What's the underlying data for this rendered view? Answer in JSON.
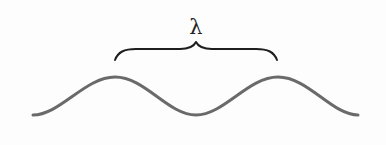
{
  "diagram": {
    "label": "λ",
    "label_meaning": "wavelength",
    "colors": {
      "background": "#fdfdfd",
      "wave": "#6a6a6a",
      "brace": "#1e1e1e",
      "label": "#222222"
    },
    "wave": {
      "start": [
        33,
        115
      ],
      "end": [
        358,
        115
      ],
      "peaks": [
        [
          115,
          77
        ],
        [
          278,
          77
        ]
      ],
      "trough": [
        196,
        115
      ]
    },
    "brace": {
      "start": [
        115,
        60
      ],
      "end": [
        277,
        60
      ],
      "cusp": [
        196,
        42
      ]
    }
  }
}
